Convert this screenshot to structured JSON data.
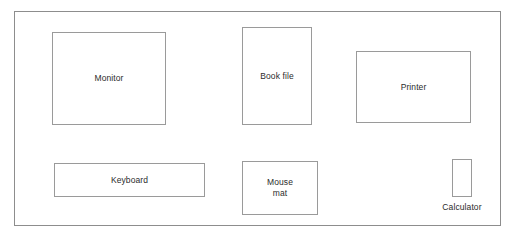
{
  "scene": {
    "title": "Desk layout diagram",
    "background_color": "#ffffff",
    "frame": {
      "name": "desk-outline",
      "border_color": "#8d8d8d"
    }
  },
  "items": [
    {
      "id": "monitor",
      "label": "Monitor",
      "label_position": "inside",
      "border_color": "#9a9a9a",
      "x": 51,
      "y": 31,
      "width": 114,
      "height": 93
    },
    {
      "id": "book-file",
      "label": "Book file",
      "label_position": "inside",
      "border_color": "#9a9a9a",
      "x": 241,
      "y": 26,
      "width": 70,
      "height": 98
    },
    {
      "id": "printer",
      "label": "Printer",
      "label_position": "inside",
      "border_color": "#9a9a9a",
      "x": 355,
      "y": 50,
      "width": 115,
      "height": 72
    },
    {
      "id": "keyboard",
      "label": "Keyboard",
      "label_position": "inside",
      "border_color": "#9a9a9a",
      "x": 53,
      "y": 162,
      "width": 151,
      "height": 34
    },
    {
      "id": "mouse-mat",
      "label": "Mouse\nmat",
      "label_position": "inside",
      "border_color": "#9a9a9a",
      "x": 241,
      "y": 160,
      "width": 76,
      "height": 54
    },
    {
      "id": "calculator",
      "label": "Calculator",
      "label_position": "below",
      "border_color": "#9a9a9a",
      "x": 451,
      "y": 158,
      "width": 20,
      "height": 38
    }
  ]
}
